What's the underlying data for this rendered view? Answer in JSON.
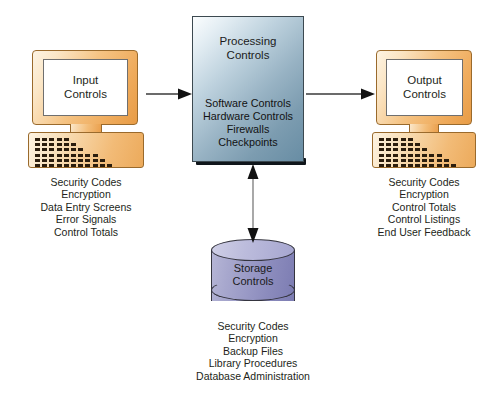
{
  "diagram": {
    "background_color": "#ffffff",
    "colors": {
      "monitor_fill": "#f3bd79",
      "monitor_outline": "#9a6a2c",
      "processing_fill": "#97b2c3",
      "processing_outline": "#3c4950",
      "storage_fill": "#9a9ac6",
      "storage_outline": "#35353f",
      "arrow": "#3a3a3a",
      "text": "#231f20"
    }
  },
  "input": {
    "screen_title_line1": "Input",
    "screen_title_line2": "Controls",
    "caption_items": [
      "Security Codes",
      "Encryption",
      "Data Entry Screens",
      "Error Signals",
      "Control Totals"
    ]
  },
  "processing": {
    "title_line1": "Processing",
    "title_line2": "Controls",
    "items": [
      "Software Controls",
      "Hardware Controls",
      "Firewalls",
      "Checkpoints"
    ]
  },
  "output": {
    "screen_title_line1": "Output",
    "screen_title_line2": "Controls",
    "caption_items": [
      "Security Codes",
      "Encryption",
      "Control Totals",
      "Control Listings",
      "End User Feedback"
    ]
  },
  "storage": {
    "label_line1": "Storage",
    "label_line2": "Controls",
    "caption_items": [
      "Security Codes",
      "Encryption",
      "Backup Files",
      "Library Procedures",
      "Database Administration"
    ]
  },
  "arrows": [
    {
      "name": "input-to-processing",
      "direction": "right"
    },
    {
      "name": "processing-to-output",
      "direction": "right"
    },
    {
      "name": "processing-storage",
      "direction": "both"
    }
  ]
}
